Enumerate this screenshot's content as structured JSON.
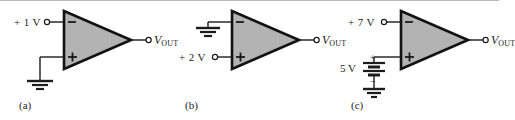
{
  "figure": {
    "background": "#ffffff",
    "wire_color": "#1c1c1c",
    "amp_fill": "#b3b3b3",
    "amp_stroke": "#111111"
  },
  "circuits": [
    {
      "id": "a",
      "caption": "(a)",
      "input_label": "+ 1 V",
      "input_terminal_sign": "−",
      "second_terminal_sign": "+",
      "second_input_source": "ground",
      "output_label_v": "V",
      "output_label_sub": "OUT",
      "amp_name": "op-amp-triangle"
    },
    {
      "id": "b",
      "caption": "(b)",
      "input_label": "+ 2 V",
      "input_terminal_sign": "+",
      "second_terminal_sign": "−",
      "second_input_source": "ground",
      "output_label_v": "V",
      "output_label_sub": "OUT",
      "amp_name": "op-amp-triangle"
    },
    {
      "id": "c",
      "caption": "(c)",
      "input_label": "+ 7 V",
      "input_terminal_sign": "−",
      "second_terminal_sign": "+",
      "second_input_source": "battery",
      "battery_label": "5 V",
      "battery_plus": "+",
      "battery_minus": "−",
      "output_label_v": "V",
      "output_label_sub": "OUT",
      "amp_name": "op-amp-triangle"
    }
  ]
}
